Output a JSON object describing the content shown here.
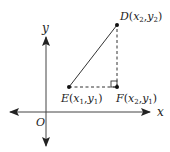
{
  "diagram": {
    "axes": {
      "x_label": "x",
      "y_label": "y",
      "origin_label": "O"
    },
    "points": {
      "D": {
        "name": "D",
        "sub_x": "2",
        "sub_y": "2"
      },
      "E": {
        "name": "E",
        "sub_x": "1",
        "sub_y": "1"
      },
      "F": {
        "name": "F",
        "sub_x": "2",
        "sub_y": "1"
      }
    },
    "segments": [
      {
        "from": "E",
        "to": "D",
        "style": "solid"
      },
      {
        "from": "E",
        "to": "F",
        "style": "dashed"
      },
      {
        "from": "F",
        "to": "D",
        "style": "dashed"
      }
    ],
    "right_angle_at": "F",
    "colors": {
      "stroke": "#222222",
      "background": "#ffffff"
    }
  }
}
